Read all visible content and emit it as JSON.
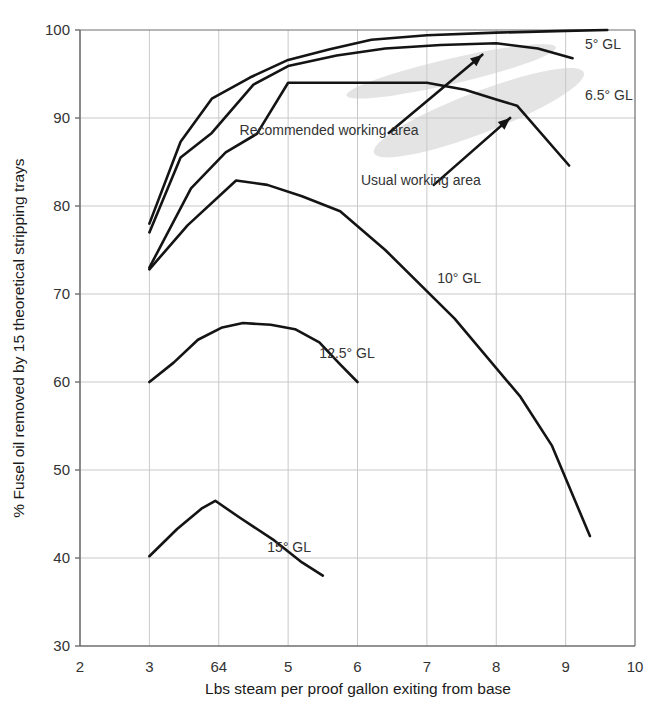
{
  "chart_data": {
    "type": "line",
    "title": "",
    "xlabel": "Lbs steam per proof gallon exiting from base",
    "ylabel": "% Fusel oil removed by 15 theoretical stripping trays",
    "xlim": [
      2,
      10
    ],
    "ylim": [
      30,
      100
    ],
    "xticks": [
      "2",
      "3",
      "64",
      "5",
      "6",
      "7",
      "8",
      "9",
      "10"
    ],
    "xtick_values": [
      2,
      3,
      4,
      5,
      6,
      7,
      8,
      9,
      10
    ],
    "yticks": [
      "30",
      "40",
      "50",
      "60",
      "70",
      "80",
      "90",
      "100"
    ],
    "ytick_values": [
      30,
      40,
      50,
      60,
      70,
      80,
      90,
      100
    ],
    "grid": true,
    "legend_position": "right-inline",
    "line_color": "#141414",
    "grid_color": "#c9c9c9",
    "axis_color": "#6e6e6e",
    "shaded_band_color": "#e2e2e2",
    "series": [
      {
        "name": "5° GL",
        "label": "5° GL",
        "label_x": 9.28,
        "label_y": 98.4,
        "x": [
          3.0,
          3.45,
          3.9,
          4.45,
          5.0,
          5.6,
          6.2,
          7.0,
          8.0,
          9.0,
          9.6
        ],
        "y": [
          78.0,
          87.3,
          92.2,
          94.6,
          96.6,
          97.8,
          98.9,
          99.4,
          99.7,
          99.9,
          100.0
        ]
      },
      {
        "name": "6.5° GL",
        "label": "6.5° GL",
        "label_x": 9.28,
        "label_y": 92.6,
        "x": [
          3.0,
          3.45,
          3.9,
          4.5,
          5.0,
          5.7,
          6.4,
          7.2,
          8.0,
          8.6,
          9.1
        ],
        "y": [
          77.0,
          85.5,
          88.3,
          93.8,
          95.9,
          97.1,
          97.9,
          98.3,
          98.5,
          97.9,
          96.8
        ]
      },
      {
        "name": "8° GL",
        "label": "",
        "label_x": null,
        "label_y": null,
        "x": [
          3.0,
          3.6,
          4.1,
          4.55,
          5.0,
          6.0,
          7.0,
          7.55,
          8.0,
          8.3,
          9.05
        ],
        "y": [
          73.0,
          82.0,
          86.1,
          88.2,
          94.0,
          94.0,
          94.0,
          93.2,
          92.1,
          91.4,
          84.6
        ]
      },
      {
        "name": "10° GL",
        "label": "10° GL",
        "label_x": 7.15,
        "label_y": 71.8,
        "x": [
          3.0,
          3.55,
          4.25,
          4.7,
          5.2,
          5.75,
          6.4,
          7.4,
          8.35,
          8.8,
          9.35
        ],
        "y": [
          72.8,
          77.8,
          82.9,
          82.4,
          81.1,
          79.4,
          75.0,
          67.2,
          58.3,
          52.8,
          42.5
        ]
      },
      {
        "name": "12.5° GL",
        "label": "12.5° GL",
        "label_x": 5.45,
        "label_y": 63.3,
        "x": [
          3.0,
          3.35,
          3.7,
          4.05,
          4.35,
          4.75,
          5.1,
          5.45,
          5.75,
          6.0
        ],
        "y": [
          60.0,
          62.2,
          64.8,
          66.2,
          66.7,
          66.5,
          66.0,
          64.5,
          62.0,
          60.0
        ]
      },
      {
        "name": "15° GL",
        "label": "15° GL",
        "label_x": 4.7,
        "label_y": 41.2,
        "x": [
          3.0,
          3.4,
          3.75,
          3.95,
          4.3,
          4.8,
          5.2,
          5.5
        ],
        "y": [
          40.2,
          43.3,
          45.6,
          46.5,
          44.6,
          42.0,
          39.5,
          38.0
        ]
      }
    ],
    "annotations": [
      {
        "name": "recommended-working-area",
        "text": "Recommended working area",
        "text_x": 4.3,
        "text_y": 88.6,
        "arrow_from_x": 6.45,
        "arrow_from_y": 88.3,
        "arrow_to_x": 7.8,
        "arrow_to_y": 97.2
      },
      {
        "name": "usual-working-area",
        "text": "Usual working area",
        "text_x": 6.05,
        "text_y": 83.0,
        "arrow_from_x": 7.1,
        "arrow_from_y": 82.4,
        "arrow_to_x": 8.2,
        "arrow_to_y": 90.0
      }
    ],
    "shaded_bands": [
      {
        "name": "recommended-band",
        "cx": 7.35,
        "cy": 95.3,
        "rx": 1.55,
        "ry": 1.45,
        "rotation": -13
      },
      {
        "name": "usual-band",
        "cx": 7.75,
        "cy": 90.6,
        "rx": 1.62,
        "ry": 2.35,
        "rotation": -21
      }
    ]
  }
}
